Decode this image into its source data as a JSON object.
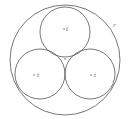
{
  "diagram": {
    "stroke_color": "#555555",
    "outer_circle": {
      "cx": 65,
      "cy": 60,
      "r": 55,
      "label": "r"
    },
    "inner_circles": [
      {
        "name": "top",
        "cx": 65,
        "cy": 32,
        "r": 25,
        "label": "t"
      },
      {
        "name": "bottom-left",
        "cx": 40,
        "cy": 74,
        "r": 25,
        "label": "t"
      },
      {
        "name": "bottom-right",
        "cx": 90,
        "cy": 74,
        "r": 25,
        "label": "t"
      }
    ],
    "center_point": {
      "cx": 65,
      "cy": 59
    }
  }
}
